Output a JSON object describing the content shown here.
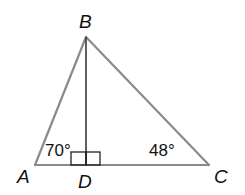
{
  "diagram": {
    "type": "triangle-with-altitude",
    "vertices": [
      {
        "id": "A",
        "label": "A",
        "x": 35,
        "y": 165,
        "lx": 17,
        "ly": 183
      },
      {
        "id": "B",
        "label": "B",
        "x": 86,
        "y": 37,
        "lx": 79,
        "ly": 28
      },
      {
        "id": "C",
        "label": "C",
        "x": 209,
        "y": 165,
        "lx": 214,
        "ly": 183
      },
      {
        "id": "D",
        "label": "D",
        "x": 86,
        "y": 165,
        "lx": 78,
        "ly": 188
      }
    ],
    "segments": [
      "AB",
      "BC",
      "AC",
      "BD"
    ],
    "angles": [
      {
        "at": "A",
        "label": "70°",
        "x": 45,
        "y": 156
      },
      {
        "at": "C",
        "label": "48°",
        "x": 149,
        "y": 156
      }
    ],
    "right_angle_marks": [
      {
        "at": "D",
        "side": "left"
      },
      {
        "at": "D",
        "side": "right"
      }
    ],
    "colors": {
      "triangle_edge": "#8a8a8a",
      "altitude": "#3a3a3a",
      "text": "#111111",
      "background": "#ffffff"
    }
  }
}
